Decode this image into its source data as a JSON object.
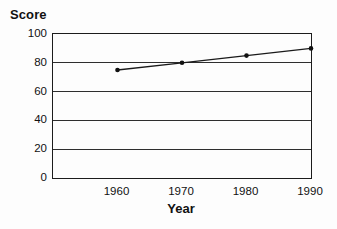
{
  "chart_data": {
    "type": "line",
    "title": "",
    "ylabel": "Score",
    "xlabel": "Year",
    "x": [
      1960,
      1970,
      1980,
      1990
    ],
    "values": [
      75,
      80,
      85,
      90
    ],
    "series": [
      {
        "name": "Score",
        "x": [
          1960,
          1970,
          1980,
          1990
        ],
        "values": [
          75,
          80,
          85,
          90
        ]
      }
    ],
    "xlim": [
      1950,
      1990
    ],
    "ylim": [
      0,
      100
    ],
    "yticks": [
      0,
      20,
      40,
      60,
      80,
      100
    ],
    "xticks": [
      1960,
      1970,
      1980,
      1990
    ],
    "grid": "horizontal",
    "legend": "none",
    "frame": "box",
    "line_color": "#1a1a1a",
    "marker": "circle",
    "marker_color": "#111111",
    "gridline_color": "#2e2e2e",
    "text_color": "#111111",
    "background_color": "#fdfdfd"
  }
}
